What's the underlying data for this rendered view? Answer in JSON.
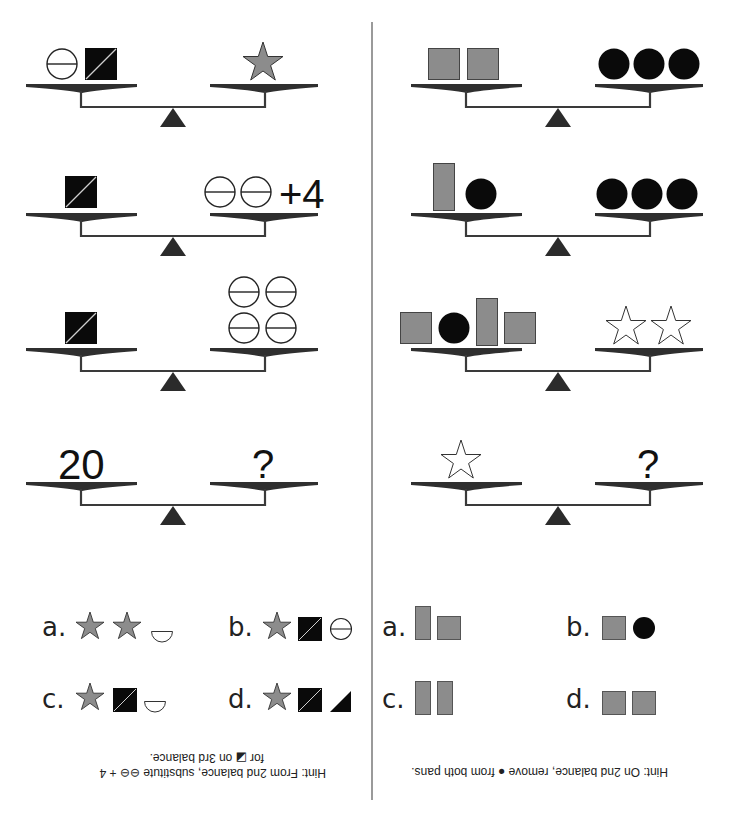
{
  "colors": {
    "gray_fill": "#8c8c8c",
    "black_fill": "#0a0a0a",
    "beam": "#3a3a3a",
    "pan": "#2f2f2f",
    "fulcrum": "#2b2b2b",
    "divider": "#9a9a9a"
  },
  "left_puzzle": {
    "balances": [
      {
        "left": [
          "circle-line",
          "square-diagonal"
        ],
        "right": [
          "star-gray"
        ]
      },
      {
        "left": [
          "square-diagonal"
        ],
        "right": [
          "circle-line",
          "circle-line"
        ],
        "right_text": "+4"
      },
      {
        "left": [
          "square-diagonal"
        ],
        "right": [
          "circle-line",
          "circle-line",
          "circle-line",
          "circle-line"
        ]
      },
      {
        "left_text": "20",
        "right_text": "?"
      }
    ],
    "options": [
      {
        "label": "a.",
        "items": [
          "star-gray",
          "star-gray",
          "semicircle"
        ]
      },
      {
        "label": "b.",
        "items": [
          "star-gray",
          "square-diagonal",
          "circle-line"
        ]
      },
      {
        "label": "c.",
        "items": [
          "star-gray",
          "square-diagonal",
          "semicircle"
        ]
      },
      {
        "label": "d.",
        "items": [
          "star-gray",
          "square-diagonal",
          "triangle-half"
        ]
      }
    ],
    "hint_line1": "Hint:  From 2nd balance, substitute ⊖⊖ + 4",
    "hint_line2": "for ◪ on 3rd balance."
  },
  "right_puzzle": {
    "balances": [
      {
        "left": [
          "square-gray",
          "square-gray"
        ],
        "right": [
          "circle-black",
          "circle-black",
          "circle-black"
        ]
      },
      {
        "left": [
          "rect-tall-gray",
          "circle-black"
        ],
        "right": [
          "circle-black",
          "circle-black",
          "circle-black"
        ]
      },
      {
        "left": [
          "square-gray",
          "circle-black",
          "rect-tall-gray",
          "square-gray"
        ],
        "right": [
          "star-outline",
          "star-outline"
        ]
      },
      {
        "left": [
          "star-outline"
        ],
        "right_text": "?"
      }
    ],
    "options": [
      {
        "label": "a.",
        "items": [
          "rect-tall-gray",
          "square-gray"
        ]
      },
      {
        "label": "b.",
        "items": [
          "square-gray",
          "circle-black"
        ]
      },
      {
        "label": "c.",
        "items": [
          "rect-tall-gray",
          "rect-tall-gray"
        ]
      },
      {
        "label": "d.",
        "items": [
          "square-gray",
          "square-gray"
        ]
      }
    ],
    "hint_line1": "Hint:  On 2nd balance, remove ● from both pans."
  }
}
